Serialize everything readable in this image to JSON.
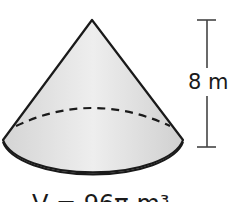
{
  "figure": {
    "shape": "cone",
    "height_label": "8 m",
    "volume_label": "V = 96π m³",
    "colors": {
      "fill": "#e3e3e3",
      "stroke": "#1a1a1a",
      "background": "#ffffff"
    }
  }
}
